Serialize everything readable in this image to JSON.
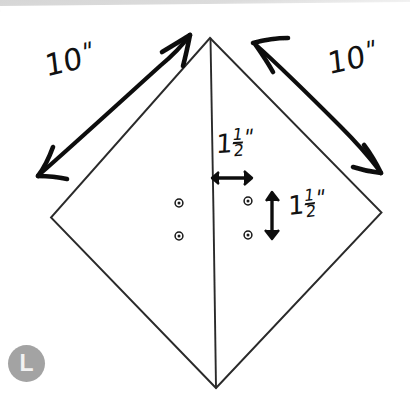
{
  "canvas": {
    "width": 410,
    "height": 410,
    "background": "#ffffff",
    "ink_color": "#111111",
    "shape_line_color": "#2b2b2b"
  },
  "figure": {
    "name": "kite-diagram",
    "type": "hand-drawn-geometry-sketch",
    "shape": "diamond-kite-with-vertical-center-line",
    "vertices": {
      "top": [
        210,
        38
      ],
      "right": [
        381,
        212
      ],
      "bottom": [
        216,
        388
      ],
      "left": [
        51,
        217
      ]
    },
    "center_line": {
      "from": [
        210,
        38
      ],
      "to": [
        216,
        388
      ]
    }
  },
  "annotations": {
    "left_side": {
      "label_whole": "10",
      "label_inch": "\"",
      "full_text": "10\"",
      "arrow": "double-headed-arrow-diagonal-up-right",
      "arrow_from": [
        38,
        176
      ],
      "arrow_to": [
        191,
        34
      ]
    },
    "right_side": {
      "label_whole": "10",
      "label_inch": "\"",
      "full_text": "10\"",
      "arrow": "double-headed-arrow-diagonal-down-right",
      "arrow_from": [
        252,
        41
      ],
      "arrow_to": [
        381,
        174
      ]
    },
    "horizontal_offset": {
      "label_whole": "1",
      "label_numerator": "1",
      "label_denominator": "2",
      "label_inch": "\"",
      "full_text": "1 1/2\"",
      "arrow": "double-headed-arrow-horizontal",
      "arrow_from": [
        212,
        178
      ],
      "arrow_to": [
        251,
        178
      ]
    },
    "vertical_offset": {
      "label_whole": "1",
      "label_numerator": "1",
      "label_denominator": "2",
      "label_inch": "\"",
      "full_text": "1 1/2\"",
      "arrow": "double-headed-arrow-vertical",
      "arrow_from": [
        272,
        192
      ],
      "arrow_to": [
        272,
        239
      ]
    }
  },
  "markers": {
    "name": "grommet-holes",
    "description": "four small ring marks in 2x2 grid straddling the center line",
    "radius_outer": 4.0,
    "radius_inner": 1.6,
    "points": [
      {
        "cx": 179,
        "cy": 203
      },
      {
        "cx": 179,
        "cy": 236
      },
      {
        "cx": 248,
        "cy": 201
      },
      {
        "cx": 248,
        "cy": 235
      }
    ]
  },
  "watermark_badge": {
    "letter": "L",
    "background_color": "#a3a3a3",
    "text_color": "#f2f2f2",
    "left": 8,
    "top": 345
  }
}
